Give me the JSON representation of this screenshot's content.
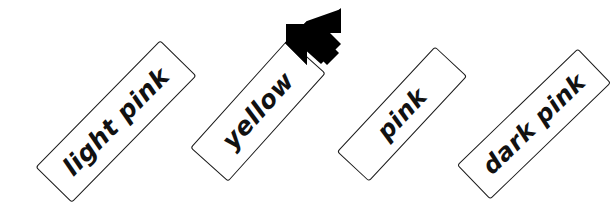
{
  "diagram": {
    "type": "labeled-cards-with-pointer",
    "background_color": "#ffffff",
    "ink_color": "#111111",
    "card_fill_color": "#ffffff",
    "card_border_color": "#1a1a1a",
    "cards": [
      {
        "id": "light-pink",
        "label": "light pink",
        "rotation_deg": -45.5,
        "highlighted": false
      },
      {
        "id": "yellow",
        "label": "yellow",
        "rotation_deg": -48,
        "highlighted": true
      },
      {
        "id": "pink",
        "label": "pink",
        "rotation_deg": -47,
        "highlighted": false
      },
      {
        "id": "dark-pink",
        "label": "dark pink",
        "rotation_deg": -44,
        "highlighted": false
      }
    ],
    "pointer": {
      "icon": "arrow-down-left-icon",
      "color": "#000000",
      "target_card_id": "yellow",
      "direction": "down-left"
    }
  }
}
